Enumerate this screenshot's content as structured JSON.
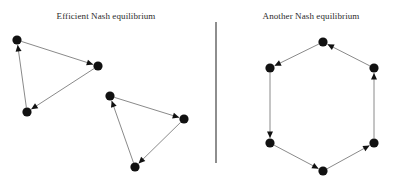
{
  "figure": {
    "width": 400,
    "height": 183,
    "background": "#ffffff",
    "divider": {
      "name": "panel-divider",
      "orientation": "vertical",
      "color": "#8e8e8e",
      "x": 215,
      "y_top": 22,
      "y_bottom": 163
    }
  },
  "panels": [
    {
      "id": "left",
      "title": "Efficient Nash equilibrium",
      "description": "Two disjoint directed 3-cycles (triangles)",
      "components": 2,
      "graphs": [
        {
          "name": "triangle-upper-left",
          "nodes": [
            {
              "id": "A1",
              "label": "",
              "x": 17,
              "y": 40
            },
            {
              "id": "A2",
              "label": "",
              "x": 98,
              "y": 66
            },
            {
              "id": "A3",
              "label": "",
              "x": 27,
              "y": 112
            }
          ],
          "edges": [
            {
              "from": "A1",
              "to": "A2"
            },
            {
              "from": "A2",
              "to": "A3"
            },
            {
              "from": "A3",
              "to": "A1"
            }
          ]
        },
        {
          "name": "triangle-lower-right",
          "nodes": [
            {
              "id": "B1",
              "label": "",
              "x": 110,
              "y": 96
            },
            {
              "id": "B2",
              "label": "",
              "x": 184,
              "y": 119
            },
            {
              "id": "B3",
              "label": "",
              "x": 135,
              "y": 167
            }
          ],
          "edges": [
            {
              "from": "B1",
              "to": "B2"
            },
            {
              "from": "B2",
              "to": "B3"
            },
            {
              "from": "B3",
              "to": "B1"
            }
          ]
        }
      ]
    },
    {
      "id": "right",
      "title": "Another Nash equilibrium",
      "description": "A single directed 6-cycle (hexagon)",
      "components": 1,
      "graphs": [
        {
          "name": "hexagon-cycle",
          "nodes": [
            {
              "id": "C1",
              "label": "",
              "x": 101,
              "y": 42
            },
            {
              "id": "C2",
              "label": "",
              "x": 152,
              "y": 68
            },
            {
              "id": "C3",
              "label": "",
              "x": 152,
              "y": 143
            },
            {
              "id": "C4",
              "label": "",
              "x": 101,
              "y": 171
            },
            {
              "id": "C5",
              "label": "",
              "x": 48,
              "y": 143
            },
            {
              "id": "C6",
              "label": "",
              "x": 48,
              "y": 68
            }
          ],
          "edges": [
            {
              "from": "C2",
              "to": "C1"
            },
            {
              "from": "C3",
              "to": "C2"
            },
            {
              "from": "C4",
              "to": "C3"
            },
            {
              "from": "C5",
              "to": "C4"
            },
            {
              "from": "C6",
              "to": "C5"
            },
            {
              "from": "C1",
              "to": "C6"
            }
          ]
        }
      ]
    }
  ],
  "style": {
    "node_color": "#111111",
    "node_radius": 4.6,
    "edge_color": "#8a8a8a",
    "edge_width": 1,
    "arrow_color": "#111111",
    "title_color": "#2b2b2b",
    "title_font_size": 9
  }
}
